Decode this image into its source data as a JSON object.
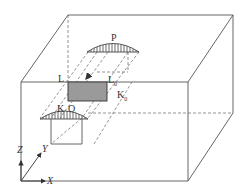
{
  "diagram": {
    "type": "3d-block-geometry",
    "colors": {
      "line": "#555555",
      "shade": "#9a9a9a",
      "background": "#ffffff"
    },
    "labels": {
      "P": "P",
      "L": "L",
      "L0": "L",
      "L0_sub": "0",
      "K0": "K",
      "K0_sub": "0",
      "K": "K",
      "O": "O",
      "axis_z": "Z",
      "axis_y": "Y",
      "axis_x": "X"
    }
  }
}
